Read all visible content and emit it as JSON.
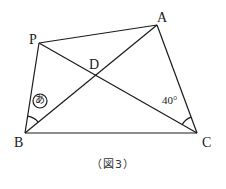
{
  "figure": {
    "caption": "（図3）",
    "points": {
      "P": {
        "label": "P",
        "x": 39,
        "y": 43
      },
      "A": {
        "label": "A",
        "x": 157,
        "y": 25
      },
      "B": {
        "label": "B",
        "x": 25,
        "y": 133
      },
      "C": {
        "label": "C",
        "x": 197,
        "y": 133
      },
      "D": {
        "label": "D",
        "x": 96,
        "y": 75
      }
    },
    "segments": [
      "PA",
      "PB",
      "BC",
      "AC",
      "PC",
      "AB"
    ],
    "angles": {
      "B": {
        "label": "あ",
        "between": "PB-AB"
      },
      "C": {
        "label": "40°",
        "between": "AC-PC"
      }
    },
    "line_color": "#1a1a1a"
  }
}
